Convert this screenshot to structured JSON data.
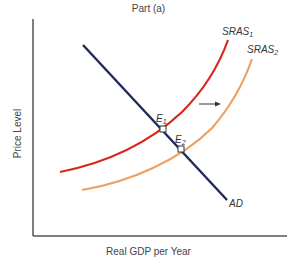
{
  "title": "Part (a)",
  "axes": {
    "y_label": "Price Level",
    "x_label": "Real GDP per Year"
  },
  "curves": {
    "ad": {
      "label": "AD",
      "color": "#1f2a5c"
    },
    "sras1": {
      "label": "SRAS",
      "subscript": "1",
      "color": "#d9261c"
    },
    "sras2": {
      "label": "SRAS",
      "subscript": "2",
      "color": "#f0a060"
    }
  },
  "points": {
    "e1": {
      "label": "E",
      "subscript": "1"
    },
    "e2": {
      "label": "E",
      "subscript": "2"
    }
  },
  "shift_arrow": {
    "direction": "right",
    "color": "#333333"
  },
  "colors": {
    "axis": "#555555",
    "text": "#444444"
  }
}
